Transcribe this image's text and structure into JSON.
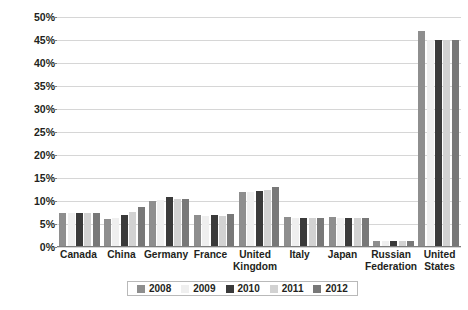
{
  "chart_data": {
    "type": "bar",
    "title": "",
    "subtitle": "",
    "xlabel": "",
    "ylabel": "Share of citations",
    "ylim": [
      0,
      50
    ],
    "ytick_step": 5,
    "ytick_labels": [
      "0%",
      "5%",
      "10%",
      "15%",
      "20%",
      "25%",
      "30%",
      "35%",
      "40%",
      "45%",
      "50%"
    ],
    "grid": true,
    "legend_position": "bottom",
    "categories": [
      "Canada",
      "China",
      "Germany",
      "France",
      "United Kingdom",
      "Italy",
      "Japan",
      "Russian Federation",
      "United States"
    ],
    "series": [
      {
        "name": "2008",
        "color": "#8e8e8e",
        "values": [
          7.5,
          6.0,
          10.0,
          7.0,
          12.0,
          6.5,
          6.5,
          1.4,
          47.0
        ]
      },
      {
        "name": "2009",
        "color": "#efefef",
        "values": [
          7.5,
          6.3,
          10.2,
          6.8,
          12.0,
          6.4,
          6.4,
          1.3,
          45.0
        ]
      },
      {
        "name": "2010",
        "color": "#3a3a3a",
        "values": [
          7.5,
          7.0,
          10.8,
          6.9,
          12.2,
          6.4,
          6.4,
          1.3,
          45.0
        ]
      },
      {
        "name": "2011",
        "color": "#d2d2d2",
        "values": [
          7.5,
          7.6,
          10.4,
          6.8,
          12.3,
          6.4,
          6.4,
          1.3,
          45.0
        ]
      },
      {
        "name": "2012",
        "color": "#787878",
        "values": [
          7.5,
          8.7,
          10.4,
          7.2,
          13.0,
          6.4,
          6.4,
          1.3,
          45.0
        ]
      }
    ]
  },
  "colors": {
    "grid": "#d6d6d6",
    "axis": "#7d7d7d",
    "text": "#231f20",
    "background": "#ffffff"
  }
}
